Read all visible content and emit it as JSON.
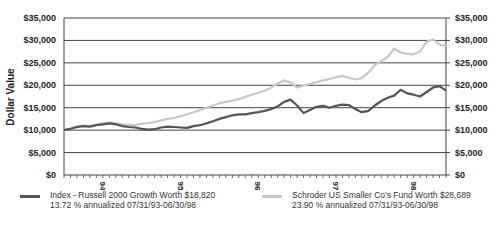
{
  "chart_data": {
    "type": "line",
    "title": "",
    "ylabel": "Dollar Value",
    "xlabel": "",
    "ylim": [
      0,
      35000
    ],
    "yticks": [
      "$0",
      "$5,000",
      "$10,000",
      "$15,000",
      "$20,000",
      "$25,000",
      "$30,000",
      "$35,000"
    ],
    "ytick_values": [
      0,
      5000,
      10000,
      15000,
      20000,
      25000,
      30000,
      35000
    ],
    "xtick_labels": [
      "94",
      "95",
      "96",
      "97",
      "98"
    ],
    "grid": true,
    "dual_y_axis": true,
    "legend_position": "bottom",
    "x_range": "07/31/93-06/30/98",
    "series": [
      {
        "name": "Index - Russell 2000 Growth",
        "legend_line1": "Index - Russell 2000 Growth Worth $18,820",
        "legend_line2": "13.72 % annualized 07/31/93-06/30/98",
        "color": "#555555",
        "final_value": 18820,
        "values": [
          10000,
          10300,
          10700,
          10900,
          10800,
          11100,
          11300,
          11500,
          11300,
          10900,
          10700,
          10600,
          10300,
          10100,
          10200,
          10600,
          10800,
          10700,
          10600,
          10500,
          10900,
          11100,
          11500,
          12000,
          12500,
          12900,
          13300,
          13500,
          13500,
          13800,
          14000,
          14300,
          14700,
          15300,
          16300,
          16800,
          15500,
          13800,
          14500,
          15200,
          15400,
          15000,
          15400,
          15700,
          15600,
          14700,
          14000,
          14300,
          15500,
          16500,
          17200,
          17700,
          19000,
          18200,
          17900,
          17500,
          18500,
          19500,
          19800,
          18820
        ]
      },
      {
        "name": "Schroder US Smaller Co's Fund",
        "legend_line1": "Schroder US Smaller Co's Fund Worth $28,689",
        "legend_line2": "23.90 % annualized 07/31/93-06/30/98",
        "color": "#c8c8c8",
        "final_value": 28689,
        "values": [
          10000,
          10300,
          10800,
          11000,
          10900,
          11200,
          11500,
          11700,
          11600,
          11300,
          11200,
          11100,
          11400,
          11600,
          11800,
          12200,
          12500,
          12700,
          13100,
          13500,
          14000,
          14500,
          15000,
          15500,
          16000,
          16300,
          16600,
          16900,
          17400,
          17900,
          18300,
          18800,
          19500,
          20400,
          21100,
          20600,
          19500,
          19900,
          20300,
          20700,
          21100,
          21400,
          21800,
          22100,
          21700,
          21300,
          21600,
          22800,
          24500,
          25400,
          26300,
          28200,
          27300,
          27000,
          26900,
          27500,
          29700,
          30200,
          29100,
          28689
        ]
      }
    ]
  },
  "axes": {
    "ylabel": "Dollar Value",
    "left_ticks": [
      "$35,000",
      "$30,000",
      "$25,000",
      "$20,000",
      "$15,000",
      "$10,000",
      "$5,000",
      "$0"
    ],
    "right_ticks": [
      "$35,000",
      "$30,000",
      "$25,000",
      "$20,000",
      "$15,000",
      "$10,000",
      "$5,000",
      "$0"
    ],
    "x_labels": [
      "94",
      "95",
      "96",
      "97",
      "98"
    ]
  },
  "legend": {
    "index": {
      "line1": "Index - Russell 2000 Growth Worth $18,820",
      "line2": "13.72 % annualized 07/31/93-06/30/98",
      "color": "#555555"
    },
    "fund": {
      "line1": "Schroder US Smaller Co's Fund Worth $28,689",
      "line2": "23.90 % annualized 07/31/93-06/30/98",
      "color": "#c8c8c8"
    }
  }
}
